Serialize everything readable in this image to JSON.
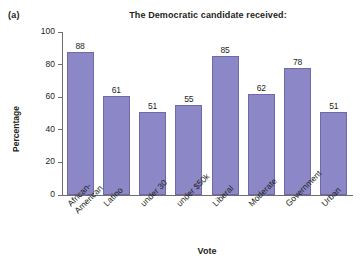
{
  "panel_label": "(a)",
  "chart_data": {
    "type": "bar",
    "title": "The Democratic candidate received:",
    "xlabel": "Vote",
    "ylabel": "Percentage",
    "ylim": [
      0,
      100
    ],
    "yticks": [
      0,
      20,
      40,
      60,
      80,
      100
    ],
    "ytick_labels": [
      "0",
      "20",
      "40",
      "60",
      "80",
      "100"
    ],
    "grid": false,
    "legend": "none",
    "bar_color": "#8c87c6",
    "bar_edge_color": "#6f69a8",
    "categories": [
      "African-\nAmerican",
      "Latino",
      "under 30",
      "under $50k",
      "Liberal",
      "Moderate",
      "Government",
      "Urban"
    ],
    "category_lines": [
      [
        "African-",
        "American"
      ],
      [
        "Latino"
      ],
      [
        "under 30"
      ],
      [
        "under $50k"
      ],
      [
        "Liberal"
      ],
      [
        "Moderate"
      ],
      [
        "Government"
      ],
      [
        "Urban"
      ]
    ],
    "values": [
      88,
      61,
      51,
      55,
      85,
      62,
      78,
      51
    ],
    "value_labels": [
      "88",
      "61",
      "51",
      "55",
      "85",
      "62",
      "78",
      "51"
    ]
  }
}
